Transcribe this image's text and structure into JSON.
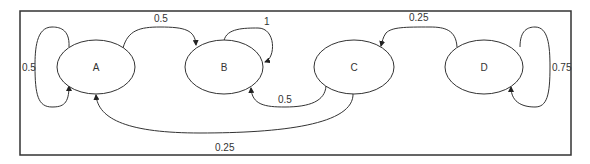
{
  "diagram": {
    "type": "markov-chain-state-transition",
    "nodes": [
      {
        "id": "A",
        "label": "A"
      },
      {
        "id": "B",
        "label": "B"
      },
      {
        "id": "C",
        "label": "C"
      },
      {
        "id": "D",
        "label": "D"
      }
    ],
    "edges": [
      {
        "from": "A",
        "to": "A",
        "label": "0.5"
      },
      {
        "from": "A",
        "to": "B",
        "label": "0.5"
      },
      {
        "from": "B",
        "to": "B",
        "label": "1"
      },
      {
        "from": "C",
        "to": "B",
        "label": "0.5"
      },
      {
        "from": "C",
        "to": "A",
        "label": "0.25"
      },
      {
        "from": "D",
        "to": "C",
        "label": "0.25"
      },
      {
        "from": "D",
        "to": "D",
        "label": "0.75"
      }
    ]
  }
}
